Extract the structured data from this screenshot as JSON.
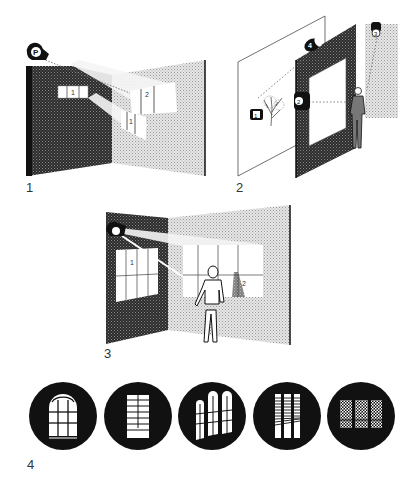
{
  "figures": [
    {
      "label": "1",
      "description": "Projector P casting window images onto two walls",
      "lamp_label": "P",
      "projection_labels": [
        "1",
        "2",
        "1"
      ]
    },
    {
      "label": "2",
      "description": "Scene with framed opening, three projectors and a figure",
      "projector_labels": [
        "1",
        "2",
        "3",
        "4"
      ]
    },
    {
      "label": "3",
      "description": "Projector casting window images, man standing in front of wall",
      "projection_labels": [
        "1",
        "2"
      ]
    },
    {
      "label": "4",
      "description": "Row of five gobo window pattern discs",
      "gobos": [
        "arched-window",
        "tall-window-bars",
        "three-arched-windows",
        "venetian-blinds",
        "leaded-lattice-window"
      ]
    }
  ],
  "colors": {
    "dark_wall": "#3a3a3a",
    "light_wall": "#c8c8c8",
    "ink": "#111111",
    "background": "#ffffff"
  }
}
